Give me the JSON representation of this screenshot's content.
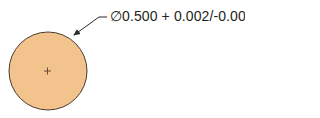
{
  "diagram": {
    "part": {
      "shape": "circle",
      "fill_color": "#f3c38d",
      "stroke_color": "#4a3a2e",
      "center_mark": "+"
    },
    "callout": {
      "symbol": "∅",
      "nominal": "0.500",
      "tolerance": "+ 0.002/-0.004",
      "text": "∅0.500 + 0.002/-0.004",
      "leader_color": "#2b2b2b"
    }
  }
}
